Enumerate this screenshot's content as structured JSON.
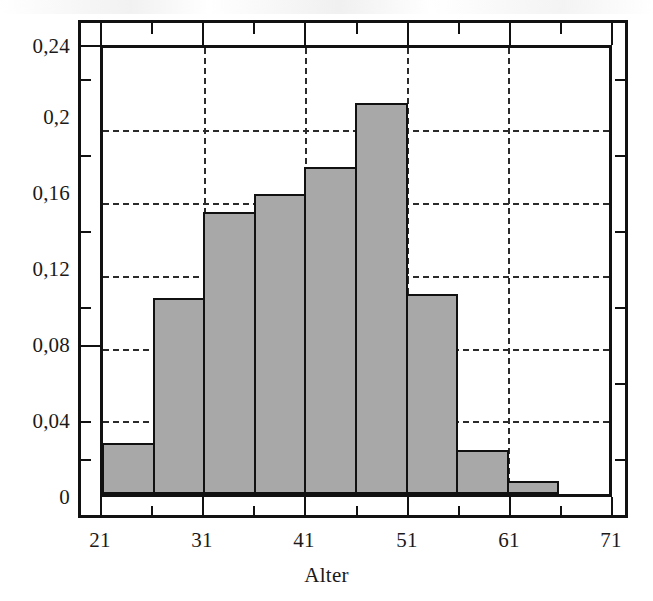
{
  "chart_data": {
    "type": "bar",
    "title": "",
    "subtitle": "",
    "xlabel": "Alter",
    "ylabel": "",
    "notation": "decimal-comma",
    "xlim": [
      21,
      71
    ],
    "ylim": [
      0,
      0.2453
    ],
    "grid": true,
    "legend": false,
    "bin_width": 5,
    "bin_edges": [
      21,
      26,
      31,
      36,
      41,
      46,
      51,
      56,
      61,
      66,
      71
    ],
    "categories": [
      "21-26",
      "26-31",
      "31-36",
      "36-41",
      "41-46",
      "46-51",
      "51-56",
      "56-61",
      "61-66",
      "66-71"
    ],
    "values": [
      0.028,
      0.108,
      0.155,
      0.165,
      0.18,
      0.215,
      0.11,
      0.024,
      0.007,
      0
    ],
    "x_ticks_major": [
      21,
      31,
      41,
      51,
      61,
      71
    ],
    "x_tick_labels": [
      "21",
      "31",
      "41",
      "51",
      "61",
      "71"
    ],
    "x_ticks_minor": [
      26,
      36,
      46,
      56,
      66
    ],
    "y_ticks_major": [
      0,
      0.04,
      0.08,
      0.12,
      0.16,
      0.2,
      0.24
    ],
    "y_tick_labels": [
      "0",
      "0,04",
      "0,08",
      "0,12",
      "0,16",
      "0,2",
      "0,24"
    ],
    "y_ticks_minor": [
      0.02,
      0.06,
      0.1,
      0.14,
      0.18,
      0.22
    ],
    "gridlines_y": [
      0.04,
      0.08,
      0.12,
      0.16,
      0.2
    ],
    "gridlines_x": [
      31,
      41,
      51,
      61
    ],
    "colors": {
      "bar_fill": "#a8a8a8",
      "bar_border": "#111111",
      "grid": "#2b2b2b",
      "axis": "#111111",
      "background": "#ffffff",
      "text": "#1a1a1a"
    }
  }
}
